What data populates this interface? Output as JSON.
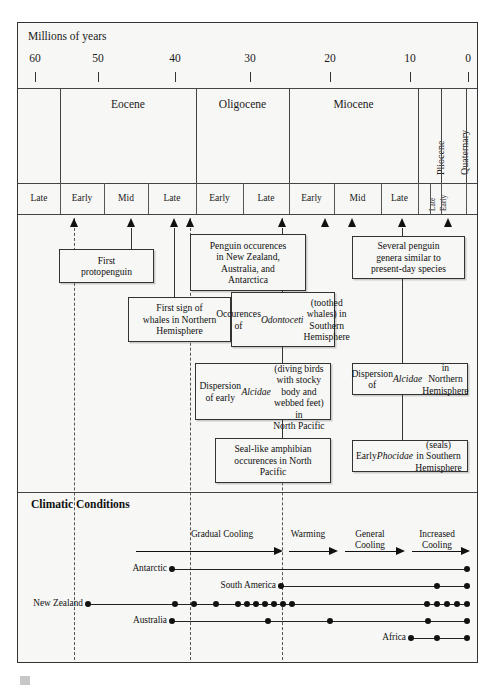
{
  "axis": {
    "title": "Millions of years",
    "ticks": [
      {
        "label": "60",
        "value": 60,
        "x": 35
      },
      {
        "label": "50",
        "value": 50,
        "x": 98
      },
      {
        "label": "40",
        "value": 40,
        "x": 175
      },
      {
        "label": "30",
        "value": 30,
        "x": 250
      },
      {
        "label": "20",
        "value": 20,
        "x": 330
      },
      {
        "label": "10",
        "value": 10,
        "x": 410
      },
      {
        "label": "0",
        "value": 0,
        "x": 468
      }
    ]
  },
  "epochs": [
    {
      "label": "",
      "x0": 18,
      "x1": 60,
      "rotated": false
    },
    {
      "label": "Eocene",
      "x0": 60,
      "x1": 196,
      "rotated": false
    },
    {
      "label": "Oligocene",
      "x0": 196,
      "x1": 289,
      "rotated": false
    },
    {
      "label": "Miocene",
      "x0": 289,
      "x1": 418,
      "rotated": false
    },
    {
      "label": "Pliocene",
      "x0": 418,
      "x1": 441,
      "rotated": true
    },
    {
      "label": "Quaternary",
      "x0": 441,
      "x1": 466,
      "rotated": true
    },
    {
      "label": "",
      "x0": 466,
      "x1": 477,
      "rotated": false
    }
  ],
  "stages": [
    {
      "label": "Late",
      "x0": 18,
      "x1": 60,
      "rotated": false
    },
    {
      "label": "Early",
      "x0": 60,
      "x1": 104,
      "rotated": false
    },
    {
      "label": "Mid",
      "x0": 104,
      "x1": 148,
      "rotated": false
    },
    {
      "label": "Late",
      "x0": 148,
      "x1": 196,
      "rotated": false
    },
    {
      "label": "Early",
      "x0": 196,
      "x1": 243,
      "rotated": false
    },
    {
      "label": "Late",
      "x0": 243,
      "x1": 289,
      "rotated": false
    },
    {
      "label": "Early",
      "x0": 289,
      "x1": 334,
      "rotated": false
    },
    {
      "label": "Mid",
      "x0": 334,
      "x1": 381,
      "rotated": false
    },
    {
      "label": "Late",
      "x0": 381,
      "x1": 418,
      "rotated": false
    },
    {
      "label": "Late",
      "x0": 418,
      "x1": 430,
      "rotated": true
    },
    {
      "label": "Early",
      "x0": 430,
      "x1": 441,
      "rotated": true
    },
    {
      "label": "",
      "x0": 441,
      "x1": 466,
      "rotated": false
    },
    {
      "label": "",
      "x0": 466,
      "x1": 477,
      "rotated": false
    }
  ],
  "event_arrows": [
    74,
    131,
    174,
    190,
    282,
    325,
    352,
    402,
    448
  ],
  "dashed_guides": [
    74,
    190,
    282
  ],
  "event_boxes": [
    {
      "name": "first-protopenguin",
      "html": "First<br>protopenguin",
      "x": 59,
      "y": 249,
      "w": 95,
      "h": 34,
      "stem_x": 131,
      "stem_top": 228,
      "stem_bottom": 249
    },
    {
      "name": "penguin-occurences-nz-aus-ant",
      "html": "Penguin occurences<br>in New Zealand,<br>Australia, and<br>Antarctica",
      "x": 190,
      "y": 234,
      "w": 116,
      "h": 57,
      "stem_x": 282,
      "stem_top": 228,
      "stem_bottom": 234
    },
    {
      "name": "first-sign-whales-northern",
      "html": "First sign of<br>whales in Northern<br>Hemisphere",
      "x": 128,
      "y": 297,
      "w": 103,
      "h": 45,
      "stem_x": 174,
      "stem_top": 228,
      "stem_bottom": 297
    },
    {
      "name": "odontoceti-southern",
      "html": "Occurences of<br><i>Odontoceti</i> (toothed<br>whales) in Southern<br>Hemisphere",
      "x": 231,
      "y": 292,
      "w": 104,
      "h": 55,
      "stem_x": 282,
      "stem_top": 291,
      "stem_bottom": 292
    },
    {
      "name": "several-penguin-genera",
      "html": "Several penguin<br>genera similar to<br>present-day species",
      "x": 352,
      "y": 236,
      "w": 113,
      "h": 43,
      "stem_x": 402,
      "stem_top": 228,
      "stem_bottom": 236
    },
    {
      "name": "dispersion-early-alcidae",
      "html": "Dispersion of early <i>Alcidae</i><br>(diving birds with stocky<br>body and webbed feet) in<br>North Pacific",
      "x": 195,
      "y": 363,
      "w": 136,
      "h": 57,
      "stem_x": 282,
      "stem_top": 347,
      "stem_bottom": 363
    },
    {
      "name": "dispersion-alcidae-northern",
      "html": "Dispersion of <i>Alcidae</i> in<br>Northern Hemisphere",
      "x": 352,
      "y": 363,
      "w": 116,
      "h": 32,
      "stem_x": 402,
      "stem_top": 279,
      "stem_bottom": 363
    },
    {
      "name": "seal-like-amphibian",
      "html": "Seal-like amphibian<br>occurences in North<br>Pacific",
      "x": 215,
      "y": 438,
      "w": 116,
      "h": 45,
      "stem_x": 282,
      "stem_top": 420,
      "stem_bottom": 438
    },
    {
      "name": "early-phocidae-southern",
      "html": "Early <i>Phocidae</i> (seals)<br>in Southern Hemisphere",
      "x": 352,
      "y": 440,
      "w": 116,
      "h": 32,
      "stem_x": 402,
      "stem_top": 395,
      "stem_bottom": 440
    }
  ],
  "climate": {
    "heading": "Climatic Conditions",
    "phases": [
      {
        "label": "Gradual Cooling",
        "text_cx": 222,
        "text_y": 529,
        "line_x0": 136,
        "line_x1": 282
      },
      {
        "label": "Warming",
        "text_cx": 308,
        "text_y": 529,
        "line_x0": 289,
        "line_x1": 337
      },
      {
        "label": "General\nCooling",
        "text_cx": 370,
        "text_y": 529,
        "line_x0": 345,
        "line_x1": 404
      },
      {
        "label": "Increased\nCooling",
        "text_cx": 437,
        "text_y": 529,
        "line_x0": 412,
        "line_x1": 469
      }
    ],
    "regions": [
      {
        "name": "Antarctic",
        "label": "Antarctic",
        "label_x": 167,
        "y": 569,
        "line_x0": 172,
        "line_x1": 467,
        "dots": [
          172,
          467
        ]
      },
      {
        "name": "South America",
        "label": "South America",
        "label_x": 276,
        "y": 586,
        "line_x0": 281,
        "line_x1": 467,
        "dots": [
          281,
          437,
          467
        ]
      },
      {
        "name": "New Zealand",
        "label": "New Zealand",
        "label_x": 83,
        "y": 604,
        "line_x0": 88,
        "line_x1": 467,
        "dots": [
          88,
          175,
          194,
          216,
          238,
          247,
          256,
          265,
          274,
          283,
          292,
          427,
          437,
          447,
          457,
          467
        ]
      },
      {
        "name": "Australia",
        "label": "Australia",
        "label_x": 167,
        "y": 621,
        "line_x0": 172,
        "line_x1": 467,
        "dots": [
          172,
          268,
          330,
          428,
          467
        ]
      },
      {
        "name": "Africa",
        "label": "Africa",
        "label_x": 406,
        "y": 638,
        "line_x0": 411,
        "line_x1": 467,
        "dots": [
          411,
          437,
          467
        ]
      }
    ]
  },
  "colors": {
    "background": "#f7f7f5",
    "border": "#333333",
    "ink": "#111111",
    "dashed": "#555555"
  }
}
